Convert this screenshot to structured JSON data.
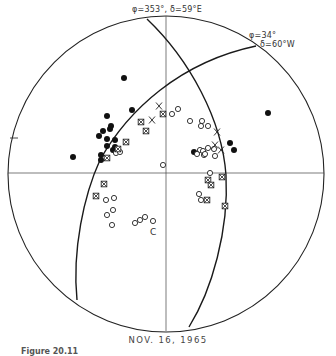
{
  "figure": {
    "title_date": "NOV. 16, 1965",
    "caption": "Figure 20.11",
    "left_tick_label": "T",
    "nodal_planes": [
      {
        "label_line1": "φ=353°, δ=59°E",
        "label_line2": ""
      },
      {
        "label_line1": "φ=34°",
        "label_line2": "δ=60°W"
      }
    ],
    "colors": {
      "stroke": "#222222",
      "background": "#ffffff"
    }
  },
  "chart_data": {
    "type": "scatter",
    "title": "NOV. 16, 1965",
    "projection": "stereographic focal sphere",
    "center": [
      166,
      173
    ],
    "radius": 158,
    "nodal_planes": [
      {
        "strike_deg": 353,
        "dip_deg": 59,
        "dip_dir": "E"
      },
      {
        "strike_deg": 34,
        "dip_deg": 60,
        "dip_dir": "W"
      }
    ],
    "legend": {
      "filled_circle": "compression",
      "open_circle": "dilatation",
      "x": "nodal / uncertain",
      "boxed_x": "uncertain reading"
    },
    "series": [
      {
        "name": "filled",
        "points": [
          [
            124,
            78
          ],
          [
            132,
            110
          ],
          [
            107,
            116
          ],
          [
            111,
            126
          ],
          [
            110,
            129
          ],
          [
            103,
            131
          ],
          [
            107,
            139
          ],
          [
            99,
            136
          ],
          [
            115,
            140
          ],
          [
            107,
            146
          ],
          [
            115,
            147
          ],
          [
            73,
            157
          ],
          [
            101,
            155
          ],
          [
            101,
            160
          ],
          [
            268,
            113
          ],
          [
            230,
            143
          ],
          [
            234,
            150
          ],
          [
            194,
            152
          ],
          [
            113,
            150
          ]
        ]
      },
      {
        "name": "open",
        "points": [
          [
            172,
            114
          ],
          [
            178,
            109
          ],
          [
            190,
            121
          ],
          [
            202,
            121
          ],
          [
            208,
            126
          ],
          [
            201,
            126
          ],
          [
            200,
            150
          ],
          [
            203,
            151
          ],
          [
            208,
            148
          ],
          [
            214,
            149
          ],
          [
            197,
            154
          ],
          [
            204,
            155
          ],
          [
            205,
            154
          ],
          [
            215,
            156
          ],
          [
            163,
            165
          ],
          [
            210,
            173
          ],
          [
            199,
            194
          ],
          [
            201,
            200
          ],
          [
            106,
            200
          ],
          [
            114,
            198
          ],
          [
            113,
            210
          ],
          [
            107,
            215
          ],
          [
            112,
            225
          ],
          [
            135,
            223
          ],
          [
            140,
            220
          ],
          [
            145,
            217
          ],
          [
            153,
            221
          ],
          [
            116,
            153
          ],
          [
            120,
            152
          ]
        ]
      },
      {
        "name": "x",
        "points": [
          [
            159,
            106
          ],
          [
            152,
            120
          ],
          [
            217,
            132
          ],
          [
            215,
            145
          ],
          [
            221,
            150
          ]
        ]
      },
      {
        "name": "boxed_x",
        "points": [
          [
            163,
            114
          ],
          [
            141,
            122
          ],
          [
            146,
            131
          ],
          [
            126,
            142
          ],
          [
            118,
            149
          ],
          [
            107,
            158
          ],
          [
            104,
            184
          ],
          [
            96,
            196
          ],
          [
            208,
            180
          ],
          [
            211,
            185
          ],
          [
            222,
            177
          ],
          [
            207,
            200
          ],
          [
            225,
            206
          ]
        ]
      }
    ]
  }
}
